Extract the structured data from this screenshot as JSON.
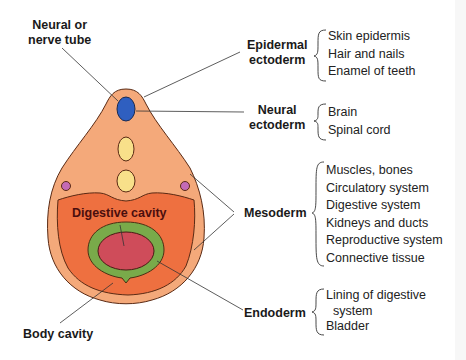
{
  "colors": {
    "outer_ectoderm": "#f4a97a",
    "body_cavity": "#ee7040",
    "endoderm_ring": "#79aa4a",
    "digestive_cavity": "#cf4c5a",
    "neural_tube": "#2f5fc0",
    "notochord_somite": "#f8e08a",
    "small_vessel": "#c46ab5",
    "outline": "#5a2a14",
    "leader_line": "#333333"
  },
  "left_labels": {
    "neural_tube": [
      "Neural or",
      "nerve tube"
    ],
    "digestive_cavity": "Digestive cavity",
    "body_cavity": "Body cavity"
  },
  "germ_layers": [
    {
      "name": [
        "Epidermal",
        "ectoderm"
      ],
      "derivatives": [
        "Skin epidermis",
        "Hair and nails",
        "Enamel of teeth"
      ]
    },
    {
      "name": [
        "Neural",
        "ectoderm"
      ],
      "derivatives": [
        "Brain",
        "Spinal cord"
      ]
    },
    {
      "name": [
        "Mesoderm"
      ],
      "derivatives": [
        "Muscles, bones",
        "Circulatory system",
        "Digestive system",
        "Kidneys and ducts",
        "Reproductive system",
        "Connective tissue"
      ]
    },
    {
      "name": [
        "Endoderm"
      ],
      "derivatives": [
        "Lining of digestive",
        "  system",
        "Bladder"
      ]
    }
  ]
}
